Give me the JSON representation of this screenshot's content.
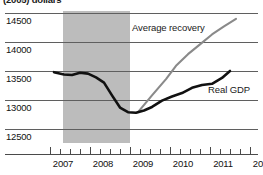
{
  "chart_title": "(2005) dollars",
  "series_labels": {
    "average_recovery": "Average recovery",
    "real_gdp": "Real GDP"
  },
  "axes": {
    "y_ticks": [
      "14500",
      "14000",
      "13500",
      "13000",
      "12500"
    ],
    "x_ticks": [
      "2007",
      "2008",
      "2009",
      "2010",
      "2011",
      "2012"
    ]
  },
  "colors": {
    "real_gdp_line": "#111111",
    "average_recovery_line": "#8a8a8a",
    "recession_band": "#bcbcbc",
    "gridline": "#5f5f5f",
    "text": "#111111"
  },
  "chart_data": {
    "type": "line",
    "title": "(2005) dollars",
    "xlabel": "",
    "ylabel": "(2005) dollars",
    "xlim": [
      2006.75,
      2012.1
    ],
    "ylim": [
      12300,
      14600
    ],
    "yticks": [
      12500,
      13000,
      13500,
      14000,
      14500
    ],
    "xticks": [
      2007,
      2008,
      2009,
      2010,
      2011,
      2012
    ],
    "grid": true,
    "legend": "inline-annotations",
    "annotations": [
      {
        "text": "Average recovery",
        "x": 2009.9,
        "y": 14350
      },
      {
        "text": "Real GDP",
        "x": 2011.4,
        "y": 13250
      }
    ],
    "shaded_regions": [
      {
        "label": "recession",
        "x_start": 2007.35,
        "x_end": 2009.0,
        "color": "#bcbcbc"
      }
    ],
    "series": [
      {
        "name": "Real GDP",
        "color": "#111111",
        "x": [
          2007.1,
          2007.35,
          2007.55,
          2007.75,
          2007.95,
          2008.15,
          2008.35,
          2008.55,
          2008.75,
          2008.95,
          2009.15,
          2009.35,
          2009.55,
          2009.8,
          2010.05,
          2010.3,
          2010.55,
          2010.8,
          2011.05,
          2011.3,
          2011.5
        ],
        "y": [
          13480,
          13440,
          13430,
          13470,
          13455,
          13390,
          13300,
          13080,
          12870,
          12790,
          12780,
          12820,
          12880,
          12990,
          13060,
          13120,
          13210,
          13260,
          13280,
          13380,
          13500
        ]
      },
      {
        "name": "Average recovery",
        "color": "#8a8a8a",
        "x": [
          2009.2,
          2009.55,
          2009.9,
          2010.15,
          2010.45,
          2010.75,
          2011.05,
          2011.35,
          2011.65
        ],
        "y": [
          12790,
          13080,
          13360,
          13590,
          13790,
          13960,
          14130,
          14270,
          14400
        ]
      }
    ]
  }
}
